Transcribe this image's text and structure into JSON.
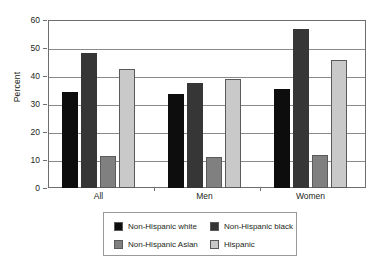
{
  "chart_data": {
    "type": "bar",
    "title": "",
    "subtitle": "",
    "xlabel": "",
    "ylabel": "Percent",
    "ylim": [
      0,
      60
    ],
    "yticks": [
      0,
      10,
      20,
      30,
      40,
      50,
      60
    ],
    "ytick_labels": [
      "0",
      "10",
      "20",
      "30",
      "40",
      "50",
      "60"
    ],
    "grid": true,
    "legend_position": "bottom",
    "categories": [
      "All",
      "Men",
      "Women"
    ],
    "series": [
      {
        "name": "Non-Hispanic white",
        "color": "#0d0d0d",
        "values": [
          34.3,
          33.5,
          35.4
        ]
      },
      {
        "name": "Non-Hispanic black",
        "color": "#363636",
        "values": [
          48.2,
          37.4,
          56.8
        ]
      },
      {
        "name": "Non-Hispanic Asian",
        "color": "#808080",
        "values": [
          11.6,
          11.2,
          11.9
        ]
      },
      {
        "name": "Hispanic",
        "color": "#c9c9c9",
        "values": [
          42.5,
          39.0,
          45.6
        ]
      }
    ]
  },
  "axis": {
    "y_title": "Percent"
  },
  "legend": {
    "items": [
      {
        "label": "Non-Hispanic white"
      },
      {
        "label": "Non-Hispanic black"
      },
      {
        "label": "Non-Hispanic Asian"
      },
      {
        "label": "Hispanic"
      }
    ]
  }
}
